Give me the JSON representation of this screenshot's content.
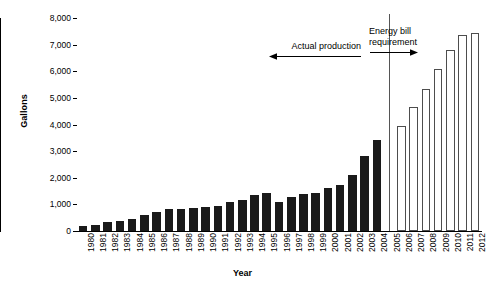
{
  "chart_data": {
    "type": "bar",
    "title": "",
    "xlabel": "Year",
    "ylabel": "Gallons",
    "ylim": [
      0,
      8000
    ],
    "ytick_values": [
      0,
      1000,
      2000,
      3000,
      4000,
      5000,
      6000,
      7000,
      8000
    ],
    "ytick_labels": [
      "0",
      "1,000",
      "2,000",
      "3,000",
      "4,000",
      "5,000",
      "6,000",
      "7,000",
      "8,000"
    ],
    "grid": false,
    "legend_position": "none",
    "categories": [
      "1980",
      "1981",
      "1982",
      "1983",
      "1984",
      "1985",
      "1986",
      "1987",
      "1988",
      "1989",
      "1990",
      "1991",
      "1992",
      "1993",
      "1994",
      "1995",
      "1996",
      "1997",
      "1998",
      "1999",
      "2000",
      "2001",
      "2002",
      "2003",
      "2004",
      "2005",
      "2006",
      "2007",
      "2008",
      "2009",
      "2010",
      "2011",
      "2012"
    ],
    "series": [
      {
        "name": "Actual production",
        "color": "#1a1a1a",
        "style": "filled",
        "values": [
          175,
          215,
          350,
          375,
          440,
          610,
          710,
          830,
          820,
          870,
          900,
          950,
          1090,
          1180,
          1340,
          1410,
          1090,
          1280,
          1400,
          1430,
          1610,
          1740,
          2090,
          2800,
          3400,
          null,
          null,
          null,
          null,
          null,
          null,
          null,
          null
        ]
      },
      {
        "name": "Energy bill requirement",
        "color": "#ffffff",
        "style": "outlined",
        "values": [
          null,
          null,
          null,
          null,
          null,
          null,
          null,
          null,
          null,
          null,
          null,
          null,
          null,
          null,
          null,
          null,
          null,
          null,
          null,
          null,
          null,
          null,
          null,
          null,
          null,
          null,
          3930,
          4650,
          5350,
          6080,
          6780,
          7370,
          7420
        ]
      }
    ],
    "annotations": [
      {
        "id": "actual-production",
        "text": "Actual production",
        "arrow": "left"
      },
      {
        "id": "energy-bill-requirement",
        "text_line1": "Energy bill",
        "text_line2": "requirement",
        "arrow": "right"
      }
    ],
    "divider": {
      "at_category": "2005",
      "color": "#555555"
    }
  }
}
